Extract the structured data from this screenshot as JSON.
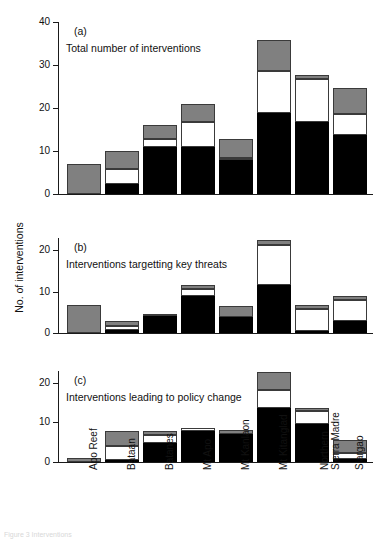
{
  "figure": {
    "ylabel": "No. of interventions",
    "caption": "Figure 3 Interventions"
  },
  "chart_data": {
    "type": "bar",
    "subtype": "stacked-bar",
    "title": "",
    "xlabel": "",
    "ylabel": "No. of interventions",
    "grid": false,
    "legend": "none",
    "categories": [
      "Apo Reef",
      "Bataan",
      "Batanes",
      "Mt Apo",
      "Mt Kanlaon",
      "Mt Kitanglad",
      "Northern Sierra Madre",
      "Siargao"
    ],
    "category_lines": [
      [
        "Apo Reef"
      ],
      [
        "Bataan"
      ],
      [
        "Batanes"
      ],
      [
        "Mt Apo"
      ],
      [
        "Mt Kanlaon"
      ],
      [
        "Mt Kitanglad"
      ],
      [
        "Northern",
        "Sierra Madre"
      ],
      [
        "Siargao"
      ]
    ],
    "stack_order": [
      "black",
      "white",
      "gray"
    ],
    "series_colors": {
      "black": "#000000",
      "white": "#ffffff",
      "gray": "#808080",
      "lgray": "#c6c6c6"
    },
    "panels": [
      {
        "id": "a",
        "letter": "(a)",
        "description": "Total number of interventions",
        "ylim": [
          0,
          40
        ],
        "yticks": [
          0,
          10,
          20,
          30,
          40
        ],
        "series": [
          {
            "name": "black",
            "values": [
              0.0,
              2.4,
              11.0,
              10.9,
              7.8,
              18.9,
              16.7,
              13.7
            ]
          },
          {
            "name": "white",
            "values": [
              0.0,
              3.5,
              1.8,
              5.8,
              0.5,
              9.8,
              10.0,
              4.9
            ]
          },
          {
            "name": "gray",
            "values": [
              7.0,
              4.1,
              3.2,
              4.3,
              4.5,
              7.1,
              1.0,
              6.1
            ]
          }
        ],
        "totals": [
          7.0,
          10.0,
          16.0,
          21.0,
          12.8,
          35.8,
          27.7,
          24.7
        ]
      },
      {
        "id": "b",
        "letter": "(b)",
        "description": "Interventions targetting key threats",
        "ylim": [
          0,
          23
        ],
        "yticks": [
          0,
          10,
          20
        ],
        "series": [
          {
            "name": "black",
            "values": [
              0.0,
              0.8,
              4.0,
              9.0,
              3.9,
              11.7,
              0.6,
              2.8
            ]
          },
          {
            "name": "white",
            "values": [
              0.0,
              1.0,
              0.0,
              1.6,
              0.0,
              9.6,
              5.2,
              5.1
            ]
          },
          {
            "name": "gray",
            "values": [
              6.9,
              1.0,
              0.6,
              1.1,
              2.7,
              1.1,
              0.9,
              1.1
            ]
          }
        ],
        "totals": [
          6.9,
          2.8,
          4.6,
          11.7,
          6.6,
          22.4,
          6.7,
          9.0
        ]
      },
      {
        "id": "c",
        "letter": "(c)",
        "description": "Interventions leading to policy change",
        "ylim": [
          0,
          23
        ],
        "yticks": [
          0,
          10,
          20
        ],
        "series": [
          {
            "name": "black",
            "values": [
              0.0,
              0.6,
              4.8,
              7.8,
              7.0,
              13.6,
              9.6,
              0.8
            ]
          },
          {
            "name": "white",
            "values": [
              0.0,
              3.5,
              1.9,
              0.9,
              0.0,
              4.5,
              3.2,
              1.6
            ]
          },
          {
            "name": "gray",
            "values": [
              0.9,
              3.7,
              1.1,
              0.0,
              1.2,
              4.6,
              0.9,
              3.2
            ]
          }
        ],
        "totals": [
          0.9,
          7.8,
          7.8,
          8.7,
          8.2,
          22.7,
          13.7,
          5.6
        ]
      }
    ]
  }
}
